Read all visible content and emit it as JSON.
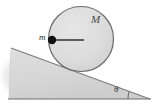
{
  "figure": {
    "kind": "physics-diagram",
    "background_color": "#ffffff"
  },
  "labels": {
    "disk_mass": "M",
    "point_mass": "m",
    "incline_angle": "θ"
  },
  "colors": {
    "disk_fill": "#dcdcdc",
    "disk_stroke": "#6b6b6b",
    "incline_fill": "#d8d8d8",
    "incline_stroke": "#8a8a8a",
    "ground_line": "#6e6e6e",
    "radius_line": "#3a3a3a",
    "point_mass_dot": "#101010",
    "shadow": "#c9c9c9"
  },
  "geometry": {
    "canvas": {
      "width": 154,
      "height": 107
    },
    "disk": {
      "cx": 81,
      "cy": 39,
      "r": 33
    },
    "point_mass_dot": {
      "x": 52,
      "y": 40,
      "r": 4
    },
    "radius_line": {
      "x1": 52,
      "y1": 40,
      "x2": 84,
      "y2": 40
    },
    "incline_triangle": {
      "apex": [
        11,
        48
      ],
      "bottom_left": [
        9,
        99
      ],
      "bottom_right": [
        150,
        99
      ]
    },
    "ground_line": {
      "x1": 8,
      "y1": 99,
      "x2": 151,
      "y2": 99
    },
    "angle_arc": {
      "vertex": [
        150,
        99
      ],
      "radius": 22
    }
  }
}
